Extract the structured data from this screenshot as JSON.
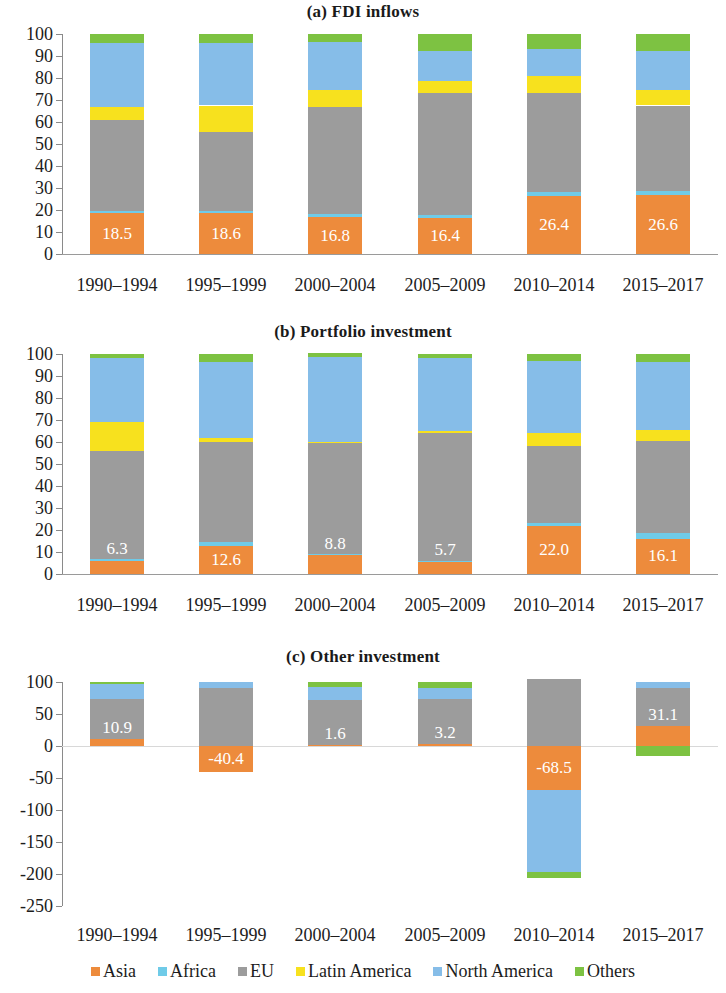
{
  "figure": {
    "categories": [
      "1990–1994",
      "1995–1999",
      "2000–2004",
      "2005–2009",
      "2010–2014",
      "2015–2017"
    ],
    "series_names": [
      "Asia",
      "Africa",
      "EU",
      "Latin America",
      "North America",
      "Others"
    ],
    "colors": {
      "Asia": "#ED8B3C",
      "Africa": "#6FCBE8",
      "EU": "#9C9C9C",
      "Latin America": "#F7E11E",
      "North America": "#86BDE8",
      "Others": "#7DC242"
    }
  },
  "legend": {
    "items": [
      {
        "label": "Asia",
        "color": "#ED8B3C"
      },
      {
        "label": "Africa",
        "color": "#6FCBE8"
      },
      {
        "label": "EU",
        "color": "#9C9C9C"
      },
      {
        "label": "Latin America",
        "color": "#F7E11E"
      },
      {
        "label": "North America",
        "color": "#86BDE8"
      },
      {
        "label": "Others",
        "color": "#7DC242"
      }
    ]
  },
  "chart_data": [
    {
      "type": "bar",
      "stacked": true,
      "title": "(a) FDI inflows",
      "xlabel": "",
      "ylabel": "",
      "ylim": [
        0,
        100
      ],
      "yticks": [
        0,
        10,
        20,
        30,
        40,
        50,
        60,
        70,
        80,
        90,
        100
      ],
      "grid": false,
      "legend_position": "bottom",
      "categories": [
        "1990–1994",
        "1995–1999",
        "2000–2004",
        "2005–2009",
        "2010–2014",
        "2015–2017"
      ],
      "series": [
        {
          "name": "Asia",
          "color": "#ED8B3C",
          "values": [
            18.5,
            18.6,
            16.8,
            16.4,
            26.4,
            26.6
          ]
        },
        {
          "name": "Africa",
          "color": "#6FCBE8",
          "values": [
            1.2,
            1.0,
            1.2,
            1.5,
            2.0,
            1.9
          ]
        },
        {
          "name": "EU",
          "color": "#9C9C9C",
          "values": [
            41.3,
            35.9,
            49.0,
            55.1,
            44.6,
            39.0
          ]
        },
        {
          "name": "Latin America",
          "color": "#F7E11E",
          "values": [
            6.0,
            12.0,
            7.5,
            5.5,
            8.0,
            7.0
          ]
        },
        {
          "name": "North America",
          "color": "#86BDE8",
          "values": [
            29.0,
            28.5,
            22.0,
            14.0,
            12.0,
            18.0
          ]
        },
        {
          "name": "Others",
          "color": "#7DC242",
          "values": [
            4.0,
            4.0,
            3.5,
            7.5,
            7.0,
            7.5
          ]
        }
      ],
      "data_labels": [
        "18.5",
        "18.6",
        "16.8",
        "16.4",
        "26.4",
        "26.6"
      ]
    },
    {
      "type": "bar",
      "stacked": true,
      "title": "(b) Portfolio investment",
      "xlabel": "",
      "ylabel": "",
      "ylim": [
        0,
        100
      ],
      "yticks": [
        0,
        10,
        20,
        30,
        40,
        50,
        60,
        70,
        80,
        90,
        100
      ],
      "grid": false,
      "legend_position": "bottom",
      "categories": [
        "1990–1994",
        "1995–1999",
        "2000–2004",
        "2005–2009",
        "2010–2014",
        "2015–2017"
      ],
      "series": [
        {
          "name": "Asia",
          "color": "#ED8B3C",
          "values": [
            6.3,
            12.6,
            8.8,
            5.7,
            22.0,
            16.1
          ]
        },
        {
          "name": "Africa",
          "color": "#6FCBE8",
          "values": [
            0.3,
            1.9,
            0.3,
            0.3,
            1.0,
            2.4
          ]
        },
        {
          "name": "EU",
          "color": "#9C9C9C",
          "values": [
            49.4,
            45.5,
            50.4,
            58.0,
            35.0,
            42.0
          ]
        },
        {
          "name": "Latin America",
          "color": "#F7E11E",
          "values": [
            13.0,
            2.0,
            0.5,
            1.0,
            6.0,
            5.0
          ]
        },
        {
          "name": "North America",
          "color": "#86BDE8",
          "values": [
            29.0,
            34.5,
            38.5,
            33.0,
            33.0,
            31.0
          ]
        },
        {
          "name": "Others",
          "color": "#7DC242",
          "values": [
            2.0,
            3.5,
            2.0,
            2.0,
            3.0,
            3.5
          ]
        }
      ],
      "data_labels": [
        "6.3",
        "12.6",
        "8.8",
        "5.7",
        "22.0",
        "16.1"
      ]
    },
    {
      "type": "bar",
      "stacked": true,
      "title": "(c) Other investment",
      "xlabel": "",
      "ylabel": "",
      "ylim": [
        -250,
        100
      ],
      "yticks": [
        100,
        50,
        0,
        -50,
        -100,
        -150,
        -200,
        -250
      ],
      "grid": false,
      "legend_position": "bottom",
      "categories": [
        "1990–1994",
        "1995–1999",
        "2000–2004",
        "2005–2009",
        "2010–2014",
        "2015–2017"
      ],
      "series": [
        {
          "name": "Asia",
          "color": "#ED8B3C",
          "values": [
            10.9,
            -40.4,
            1.6,
            3.2,
            -68.5,
            31.1
          ]
        },
        {
          "name": "Africa",
          "color": "#6FCBE8",
          "values": [
            0.0,
            0.0,
            0.0,
            0.0,
            0.0,
            0.0
          ]
        },
        {
          "name": "EU",
          "color": "#9C9C9C",
          "values": [
            62.0,
            90.0,
            70.0,
            71.0,
            105.0,
            59.0
          ]
        },
        {
          "name": "Latin America",
          "color": "#F7E11E",
          "values": [
            0.0,
            0.0,
            0.0,
            0.0,
            0.0,
            0.0
          ]
        },
        {
          "name": "North America",
          "color": "#86BDE8",
          "values": [
            24.0,
            10.0,
            21.0,
            17.0,
            -128.0,
            10.0
          ]
        },
        {
          "name": "Others",
          "color": "#7DC242",
          "values": [
            3.0,
            0.0,
            7.0,
            9.0,
            -9.0,
            -15.0
          ]
        }
      ],
      "data_labels": [
        "10.9",
        "-40.4",
        "1.6",
        "3.2",
        "-68.5",
        "31.1"
      ]
    }
  ]
}
